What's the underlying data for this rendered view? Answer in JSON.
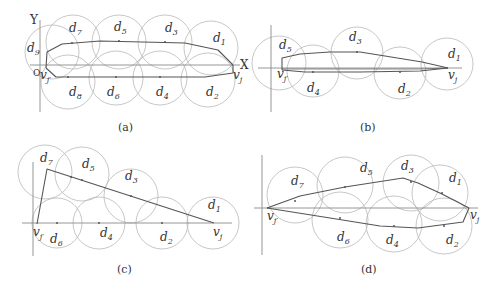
{
  "figure": {
    "panels": [
      {
        "id": "a",
        "caption": "(a)",
        "axis_labels": {
          "x": "X",
          "y": "Y",
          "origin": "O"
        },
        "start_label": "v_{j'}",
        "end_label": "v_j",
        "discs": [
          "d1",
          "d2",
          "d3",
          "d4",
          "d5",
          "d6",
          "d7",
          "d8",
          "d9"
        ]
      },
      {
        "id": "b",
        "caption": "(b)",
        "start_label": "v_{j'}",
        "end_label": "v_j",
        "discs": [
          "d1",
          "d2",
          "d3",
          "d4",
          "d5"
        ]
      },
      {
        "id": "c",
        "caption": "(c)",
        "start_label": "v_{j'}",
        "end_label": "v_j",
        "discs": [
          "d1",
          "d2",
          "d3",
          "d4",
          "d5",
          "d6",
          "d7"
        ]
      },
      {
        "id": "d",
        "caption": "(d)",
        "start_label": "v_{j'}",
        "end_label": "v_j",
        "discs": [
          "d1",
          "d2",
          "d3",
          "d4",
          "d5",
          "d6",
          "d7"
        ]
      }
    ]
  },
  "labels": {
    "a": {
      "Y": "Y",
      "X": "X",
      "O": "O",
      "v": "v",
      "j": "j",
      "jp": "j′",
      "d": "d",
      "n1": "1",
      "n2": "2",
      "n3": "3",
      "n4": "4",
      "n5": "5",
      "n6": "6",
      "n7": "7",
      "n8": "8",
      "n9": "9",
      "caption": "(a)"
    },
    "b": {
      "v": "v",
      "j": "j",
      "jp": "j′",
      "d": "d",
      "n1": "1",
      "n2": "2",
      "n3": "3",
      "n4": "4",
      "n5": "5",
      "caption": "(b)"
    },
    "c": {
      "v": "v",
      "j": "j",
      "jp": "j′",
      "d": "d",
      "n1": "1",
      "n2": "2",
      "n3": "3",
      "n4": "4",
      "n5": "5",
      "n6": "6",
      "n7": "7",
      "caption": "(c)"
    },
    "d": {
      "v": "v",
      "j": "j",
      "jp": "j′",
      "d": "d",
      "n1": "1",
      "n2": "2",
      "n3": "3",
      "n4": "4",
      "n5": "5",
      "n6": "6",
      "n7": "7",
      "caption": "(d)"
    }
  },
  "colors": {
    "circle": "#b9b9b9",
    "axis": "#8a8a8a",
    "path": "#555555",
    "text": "#333333"
  }
}
